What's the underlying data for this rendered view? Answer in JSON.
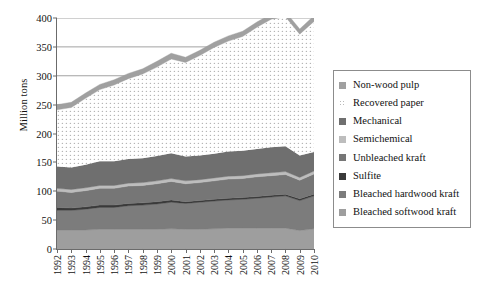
{
  "chart_data": {
    "type": "area",
    "stacked": true,
    "title": "",
    "xlabel": "",
    "ylabel": "Million tons",
    "ylim": [
      0,
      400
    ],
    "ytick_values": [
      0,
      50,
      100,
      150,
      200,
      250,
      300,
      350,
      400
    ],
    "ytick_labels": [
      "0",
      "50",
      "100",
      "150",
      "200",
      "250",
      "300",
      "350",
      "400"
    ],
    "grid": "horizontal-major",
    "legend_position": "right-outside",
    "categories": [
      "1992",
      "1993",
      "1994",
      "1995",
      "1996",
      "1997",
      "1998",
      "1999",
      "2000",
      "2001",
      "2002",
      "2003",
      "2004",
      "2005",
      "2006",
      "2007",
      "2008",
      "2009",
      "2010"
    ],
    "series": [
      {
        "name": "Bleached softwood kraft",
        "color": "#9e9e9e",
        "values": [
          33,
          33,
          33,
          34,
          34,
          34,
          34,
          34,
          35,
          34,
          34,
          35,
          36,
          36,
          36,
          36,
          36,
          32,
          35
        ]
      },
      {
        "name": "Bleached hardwood kraft",
        "color": "#7c7c7c",
        "values": [
          34,
          34,
          36,
          38,
          38,
          41,
          42,
          44,
          46,
          45,
          47,
          48,
          49,
          50,
          52,
          54,
          56,
          52,
          57
        ]
      },
      {
        "name": "Sulfite",
        "color": "#3a3a3a",
        "values": [
          5,
          4,
          4,
          4,
          4,
          4,
          4,
          4,
          4,
          3,
          3,
          3,
          3,
          3,
          3,
          3,
          3,
          3,
          3
        ]
      },
      {
        "name": "Unbleached kraft",
        "color": "#767676",
        "values": [
          28,
          27,
          28,
          29,
          29,
          30,
          30,
          31,
          32,
          31,
          31,
          32,
          33,
          33,
          34,
          34,
          34,
          32,
          35
        ]
      },
      {
        "name": "Semichemical",
        "color": "#bdbdbd",
        "values": [
          5,
          5,
          5,
          5,
          5,
          5,
          5,
          5,
          5,
          5,
          5,
          5,
          5,
          5,
          5,
          5,
          5,
          5,
          5
        ]
      },
      {
        "name": "Mechanical",
        "color": "#6f6f6f",
        "values": [
          38,
          38,
          40,
          42,
          42,
          42,
          42,
          43,
          44,
          42,
          42,
          42,
          43,
          43,
          43,
          44,
          44,
          38,
          33
        ]
      },
      {
        "name": "Recovered paper",
        "color": "#ffffff",
        "pattern": "dotted",
        "values": [
          98,
          104,
          115,
          124,
          132,
          139,
          146,
          154,
          163,
          163,
          173,
          184,
          191,
          198,
          211,
          222,
          224,
          210,
          226
        ]
      },
      {
        "name": "Non-wood pulp",
        "color": "#a0a0a0",
        "values": [
          9,
          9,
          9,
          9,
          9,
          9,
          9,
          10,
          10,
          9,
          9,
          9,
          9,
          9,
          9,
          9,
          9,
          9,
          10
        ]
      }
    ]
  },
  "axis": {
    "y_title": "Million tons"
  },
  "legend": {
    "items": [
      {
        "label": "Non-wood pulp",
        "swatch": "#a0a0a0",
        "pattern": "solid"
      },
      {
        "label": "Recovered paper",
        "swatch": "#ffffff",
        "pattern": "dotted"
      },
      {
        "label": "Mechanical",
        "swatch": "#6f6f6f",
        "pattern": "solid"
      },
      {
        "label": "Semichemical",
        "swatch": "#bdbdbd",
        "pattern": "solid"
      },
      {
        "label": "Unbleached kraft",
        "swatch": "#767676",
        "pattern": "solid"
      },
      {
        "label": "Sulfite",
        "swatch": "#3a3a3a",
        "pattern": "solid"
      },
      {
        "label": "Bleached hardwood kraft",
        "swatch": "#7c7c7c",
        "pattern": "solid"
      },
      {
        "label": "Bleached softwood kraft",
        "swatch": "#9e9e9e",
        "pattern": "solid"
      }
    ]
  }
}
